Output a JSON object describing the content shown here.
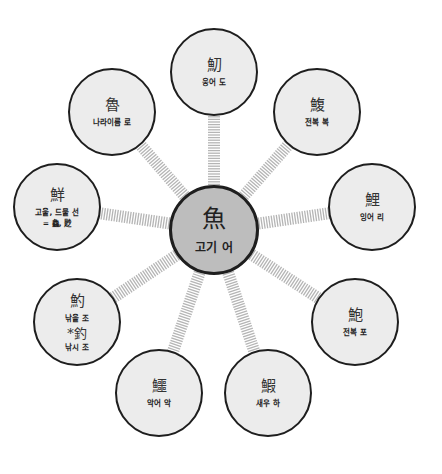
{
  "center": {
    "hanja": "魚",
    "gloss": "고기 어"
  },
  "satellites": [
    {
      "id": "top",
      "hanja": "魛",
      "gloss": "웅어 도"
    },
    {
      "id": "top-right",
      "hanja": "鰒",
      "gloss": "전복 복"
    },
    {
      "id": "right",
      "hanja": "鯉",
      "gloss": "잉어 리"
    },
    {
      "id": "bottom-right",
      "hanja": "鮑",
      "gloss": "전복 포"
    },
    {
      "id": "bottom-mid-right",
      "hanja": "鰕",
      "gloss": "새우 하"
    },
    {
      "id": "bottom-mid-left",
      "hanja": "鱷",
      "gloss": "악어 악"
    },
    {
      "id": "bottom-left",
      "hanja": "魡",
      "gloss": "낚을 조",
      "sub_hanja": "*釣",
      "sub_gloss": "낚시 조"
    },
    {
      "id": "left",
      "hanja": "鮮",
      "gloss": "고울, 드물 선",
      "gloss2": "= 鱻, 尟"
    },
    {
      "id": "top-left",
      "hanja": "魯",
      "gloss": "나라이름 로"
    }
  ],
  "colors": {
    "center_fill": "#bdbdbd",
    "node_fill": "#ececec",
    "stroke": "#1e1e1e",
    "connector": "#b5b5b5"
  }
}
